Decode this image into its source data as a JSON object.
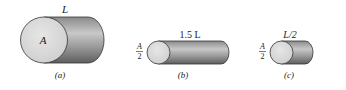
{
  "figure": {
    "panels": [
      {
        "id": "a",
        "caption": "(a)",
        "length_label": "L",
        "face_label": "A",
        "area_label": null
      },
      {
        "id": "b",
        "caption": "(b)",
        "length_label": "1.5 L",
        "face_label": null,
        "area_label": {
          "numerator": "A",
          "denominator": "2"
        }
      },
      {
        "id": "c",
        "caption": "(c)",
        "length_label": "L/2",
        "face_label": null,
        "area_label": {
          "numerator": "A",
          "denominator": "2"
        }
      }
    ],
    "colors": {
      "face": "#d9d9d9",
      "body_dark": "#6e6e6e",
      "body_light": "#c4c4c4",
      "outline": "#333333"
    }
  }
}
